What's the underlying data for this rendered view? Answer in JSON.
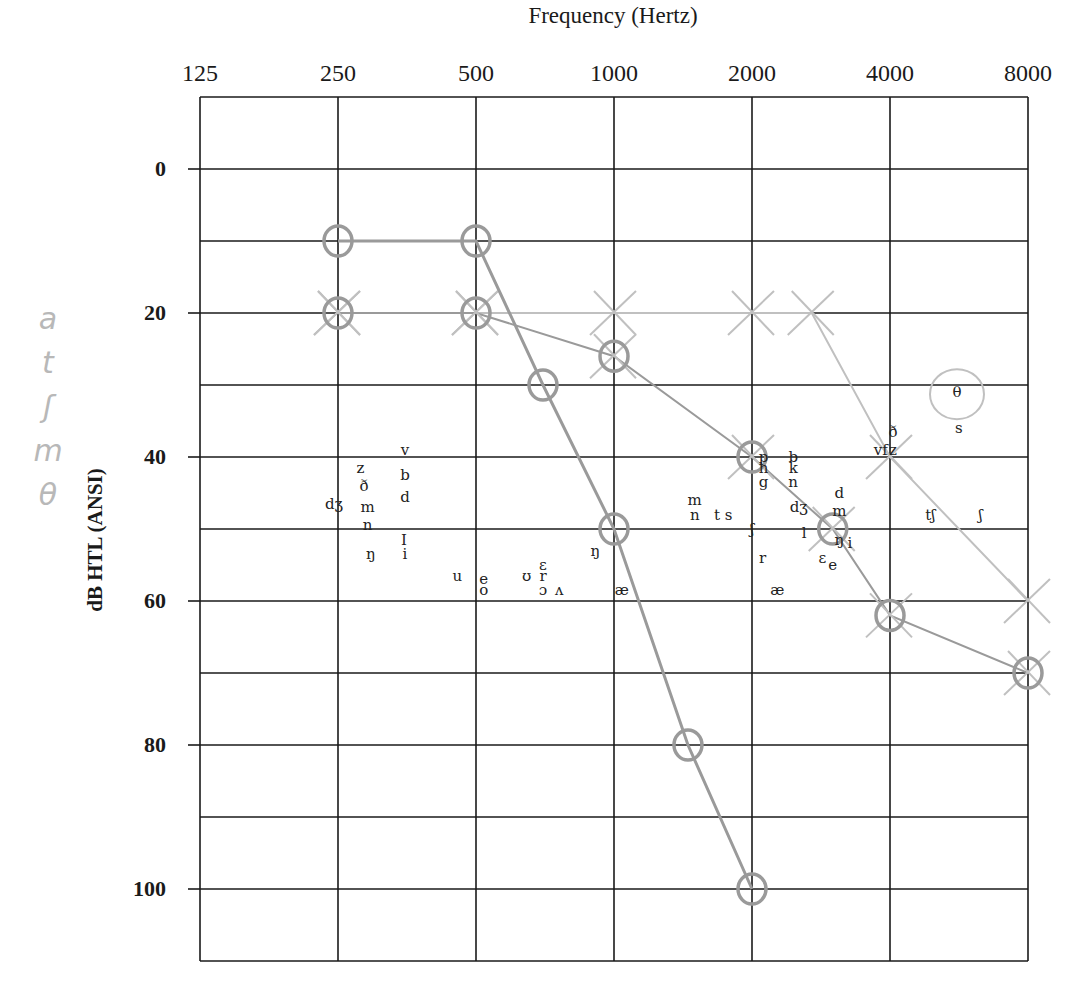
{
  "chart_data": {
    "type": "scatter",
    "title": "Frequency (Hertz)",
    "xlabel": "Frequency (Hertz)",
    "ylabel": "dB HTL (ANSI)",
    "x_scale": "log2",
    "x_ticks": [
      125,
      250,
      500,
      1000,
      2000,
      4000,
      8000
    ],
    "y_ticks": [
      0,
      20,
      40,
      60,
      80,
      100
    ],
    "ylim": [
      -10,
      110
    ],
    "y_inverted": true,
    "grid": true,
    "series": [
      {
        "name": "Threshold O (upper)",
        "marker": "circle",
        "points": [
          [
            250,
            10
          ],
          [
            500,
            10
          ],
          [
            700,
            30
          ],
          [
            1000,
            50
          ],
          [
            1450,
            80
          ],
          [
            2000,
            100
          ]
        ]
      },
      {
        "name": "Threshold X",
        "marker": "x",
        "points": [
          [
            250,
            20
          ],
          [
            500,
            20
          ],
          [
            1000,
            20
          ],
          [
            2000,
            20
          ],
          [
            2700,
            20
          ],
          [
            4000,
            40
          ],
          [
            8000,
            60
          ]
        ]
      },
      {
        "name": "Threshold O (lower)",
        "marker": "circle-over-x",
        "points": [
          [
            250,
            20
          ],
          [
            500,
            20
          ],
          [
            1000,
            26
          ],
          [
            2000,
            40
          ],
          [
            3000,
            50
          ],
          [
            4000,
            62
          ],
          [
            8000,
            70
          ]
        ]
      }
    ],
    "speech_sounds": [
      {
        "label": "v",
        "f": 350,
        "db": 39
      },
      {
        "label": "z",
        "f": 280,
        "db": 41.5
      },
      {
        "label": "b",
        "f": 350,
        "db": 42.5
      },
      {
        "label": "ð",
        "f": 285,
        "db": 44
      },
      {
        "label": "d",
        "f": 350,
        "db": 45.5
      },
      {
        "label": "dʒ",
        "f": 245,
        "db": 46.5
      },
      {
        "label": "m",
        "f": 290,
        "db": 47
      },
      {
        "label": "n",
        "f": 290,
        "db": 49.5
      },
      {
        "label": "I",
        "f": 348,
        "db": 51.5
      },
      {
        "label": "ŋ",
        "f": 295,
        "db": 53.5
      },
      {
        "label": "i",
        "f": 350,
        "db": 53.5
      },
      {
        "label": "u",
        "f": 455,
        "db": 56.5
      },
      {
        "label": "e",
        "f": 520,
        "db": 57
      },
      {
        "label": "o",
        "f": 520,
        "db": 58.5
      },
      {
        "label": "ʊ",
        "f": 645,
        "db": 56.5
      },
      {
        "label": "ɛ",
        "f": 700,
        "db": 55
      },
      {
        "label": "r",
        "f": 700,
        "db": 56.5
      },
      {
        "label": "ɔ",
        "f": 700,
        "db": 58.5
      },
      {
        "label": "ʌ",
        "f": 760,
        "db": 58.5
      },
      {
        "label": "ŋ",
        "f": 910,
        "db": 53
      },
      {
        "label": "æ",
        "f": 1040,
        "db": 58.5
      },
      {
        "label": "m",
        "f": 1500,
        "db": 46
      },
      {
        "label": "n",
        "f": 1500,
        "db": 48
      },
      {
        "label": "t s",
        "f": 1730,
        "db": 48
      },
      {
        "label": "ʃ",
        "f": 2000,
        "db": 50
      },
      {
        "label": "p",
        "f": 2120,
        "db": 40
      },
      {
        "label": "b",
        "f": 2460,
        "db": 40
      },
      {
        "label": "h",
        "f": 2120,
        "db": 41.5
      },
      {
        "label": "k",
        "f": 2460,
        "db": 41.5
      },
      {
        "label": "g",
        "f": 2120,
        "db": 43.5
      },
      {
        "label": "n",
        "f": 2460,
        "db": 43.5
      },
      {
        "label": "d",
        "f": 3100,
        "db": 45
      },
      {
        "label": "dʒ",
        "f": 2530,
        "db": 47
      },
      {
        "label": "m",
        "f": 3100,
        "db": 47.5
      },
      {
        "label": "l",
        "f": 2600,
        "db": 50.5
      },
      {
        "label": "ŋ",
        "f": 3100,
        "db": 51.5
      },
      {
        "label": "i",
        "f": 3270,
        "db": 52
      },
      {
        "label": "r",
        "f": 2110,
        "db": 54
      },
      {
        "label": "ɛ",
        "f": 2850,
        "db": 54
      },
      {
        "label": "e",
        "f": 3000,
        "db": 55
      },
      {
        "label": "æ",
        "f": 2270,
        "db": 58.5
      },
      {
        "label": "vf",
        "f": 3820,
        "db": 39
      },
      {
        "label": "z",
        "f": 4060,
        "db": 39
      },
      {
        "label": "ð",
        "f": 4060,
        "db": 36.5
      },
      {
        "label": "θ",
        "f": 5600,
        "db": 31
      },
      {
        "label": "s",
        "f": 5650,
        "db": 36
      },
      {
        "label": "tʃ",
        "f": 4900,
        "db": 48
      },
      {
        "label": "ʃ",
        "f": 6300,
        "db": 48
      }
    ],
    "annotations": {
      "theta_circle": {
        "f": 5600,
        "db": 31
      },
      "margin_handwriting": [
        "a",
        "t",
        "ʃ",
        "m",
        "θ"
      ]
    }
  },
  "labels": {
    "title": "Frequency (Hertz)",
    "ylabel": "dB HTL (ANSI)",
    "xticks": [
      "125",
      "250",
      "500",
      "1000",
      "2000",
      "4000",
      "8000"
    ],
    "yticks": [
      "0",
      "20",
      "40",
      "60",
      "80",
      "100"
    ],
    "handwriting": [
      "a",
      "t",
      "ʃ",
      "m",
      "θ"
    ]
  },
  "colors": {
    "grid": "#1a1a1a",
    "pencil": "#9a9a9a",
    "pencil_light": "#c0c0c0",
    "text": "#1a1a1a"
  }
}
